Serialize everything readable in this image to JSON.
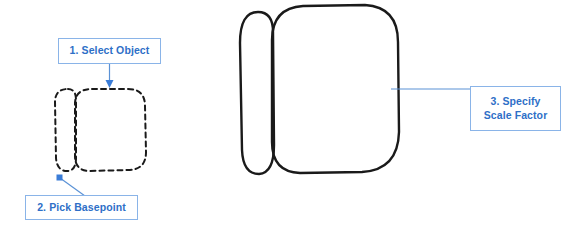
{
  "diagram": {
    "background_color": "#FFFFFF",
    "accent_color": "#2E6FC7",
    "callout_border_color": "#8AB4E8",
    "leader_color": "#5B92D6",
    "stroke_color": "#1A1A1A"
  },
  "callouts": [
    {
      "id": "select-object",
      "label": "1. Select Object",
      "step": "1",
      "leader": "arrow-down"
    },
    {
      "id": "pick-basepoint",
      "label": "2. Pick Basepoint",
      "step": "2",
      "leader": "diagonal-line-with-square-marker"
    },
    {
      "id": "specify-scale-factor",
      "label": "3. Specify\nScale Factor",
      "step": "3",
      "leader": "horizontal-line"
    }
  ],
  "shapes": {
    "source_object": {
      "name": "selected-object",
      "style": "dashed",
      "parts": [
        "rounded-square",
        "left-sliver"
      ]
    },
    "result_object": {
      "name": "scaled-object",
      "style": "solid",
      "parts": [
        "rounded-square",
        "left-sliver"
      ]
    }
  }
}
